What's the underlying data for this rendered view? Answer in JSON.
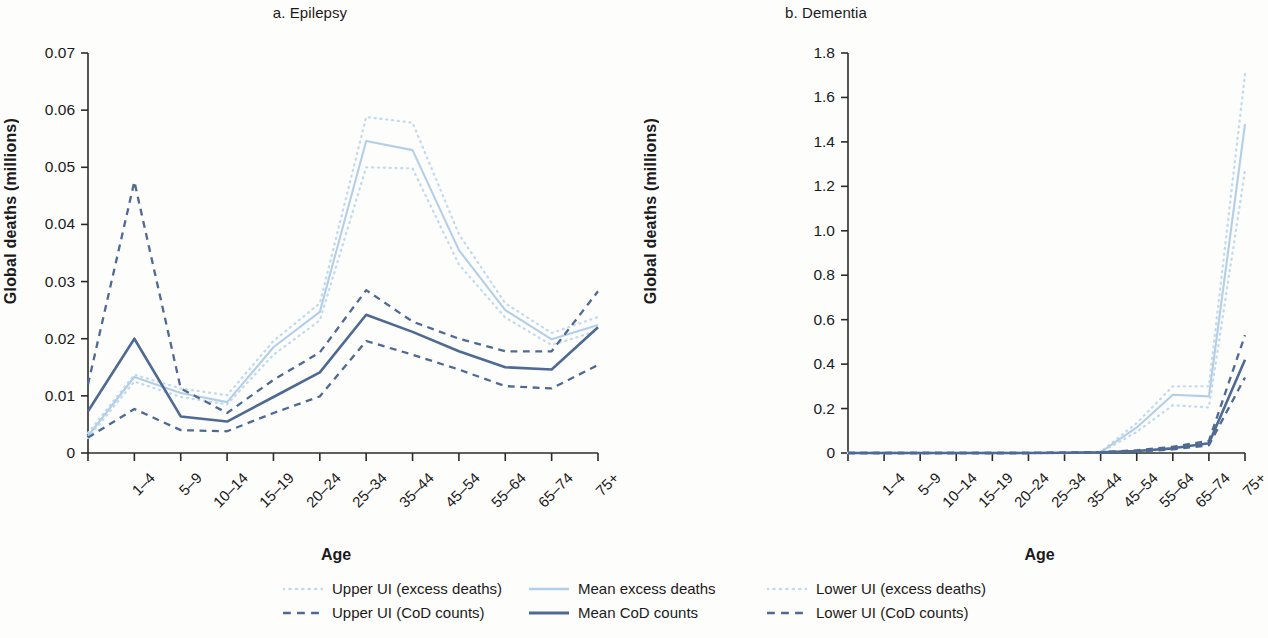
{
  "figure": {
    "background": "#fdfdfb",
    "axis_color": "#2b2b2b"
  },
  "colors": {
    "excess": "#b3cfe8",
    "excess_ui": "#c3daee",
    "cod": "#4e6a93",
    "cod_ui": "#4e6a93"
  },
  "legend": {
    "items": [
      {
        "label": "Upper UI (excess deaths)",
        "style": "dotted",
        "color": "#c3daee"
      },
      {
        "label": "Mean excess deaths",
        "style": "solid",
        "color": "#b3cfe8"
      },
      {
        "label": "Lower UI (excess deaths)",
        "style": "dotted",
        "color": "#c3daee"
      },
      {
        "label": "Upper UI (CoD counts)",
        "style": "dashed",
        "color": "#4e6a93"
      },
      {
        "label": "Mean CoD counts",
        "style": "solid",
        "color": "#4e6a93"
      },
      {
        "label": "Lower UI (CoD counts)",
        "style": "dashed",
        "color": "#4e6a93"
      }
    ]
  },
  "chart_data": [
    {
      "type": "line",
      "panel": "a",
      "title": "a. Epilepsy",
      "xlabel": "Age",
      "ylabel": "Global deaths (millions)",
      "grid": false,
      "legend_position": "bottom",
      "categories": [
        "<1",
        "1–4",
        "5–9",
        "10–14",
        "15–19",
        "20–24",
        "25–34",
        "35–44",
        "45–54",
        "55–64",
        "65–74",
        "75+"
      ],
      "tick_labels": [
        "",
        "1–4",
        "5–9",
        "10–14",
        "15–19",
        "20–24",
        "25–34",
        "35–44",
        "45–54",
        "55–64",
        "65–74",
        "75+"
      ],
      "ylim": [
        0,
        0.07
      ],
      "yticks": [
        0,
        0.01,
        0.02,
        0.03,
        0.04,
        0.05,
        0.06,
        0.07
      ],
      "ytick_labels": [
        "0",
        "0.01",
        "0.02",
        "0.03",
        "0.04",
        "0.05",
        "0.06",
        "0.07"
      ],
      "series": [
        {
          "name": "Upper UI (excess deaths)",
          "style": "dotted",
          "color": "#c3daee",
          "values": [
            0.0035,
            0.0137,
            0.0113,
            0.0101,
            0.0196,
            0.0262,
            0.0588,
            0.0578,
            0.0383,
            0.0262,
            0.021,
            0.0238
          ]
        },
        {
          "name": "Mean excess deaths",
          "style": "solid",
          "color": "#b3cfe8",
          "values": [
            0.003,
            0.0133,
            0.0105,
            0.0089,
            0.0185,
            0.0247,
            0.0546,
            0.053,
            0.0355,
            0.025,
            0.0199,
            0.0224
          ]
        },
        {
          "name": "Lower UI (excess deaths)",
          "style": "dotted",
          "color": "#c3daee",
          "values": [
            0.0026,
            0.0125,
            0.0098,
            0.0085,
            0.0172,
            0.0232,
            0.05,
            0.0498,
            0.033,
            0.0237,
            0.0189,
            0.0214
          ]
        },
        {
          "name": "Upper UI (CoD counts)",
          "style": "dashed",
          "color": "#4e6a93",
          "values": [
            0.012,
            0.0475,
            0.0113,
            0.007,
            0.0128,
            0.0176,
            0.0285,
            0.023,
            0.02,
            0.0178,
            0.0178,
            0.0283
          ]
        },
        {
          "name": "Mean CoD counts",
          "style": "solid",
          "color": "#4e6a93",
          "values": [
            0.0073,
            0.02,
            0.0064,
            0.0055,
            0.0098,
            0.0141,
            0.0242,
            0.0212,
            0.0178,
            0.015,
            0.0146,
            0.022
          ]
        },
        {
          "name": "Lower UI (CoD counts)",
          "style": "dashed",
          "color": "#4e6a93",
          "values": [
            0.0027,
            0.0077,
            0.004,
            0.0038,
            0.007,
            0.0099,
            0.0196,
            0.0172,
            0.0146,
            0.0117,
            0.0113,
            0.0154
          ]
        }
      ]
    },
    {
      "type": "line",
      "panel": "b",
      "title": "b. Dementia",
      "xlabel": "Age",
      "ylabel": "Global deaths (millions)",
      "grid": false,
      "legend_position": "bottom",
      "categories": [
        "<1",
        "1–4",
        "5–9",
        "10–14",
        "15–19",
        "20–24",
        "25–34",
        "35–44",
        "45–54",
        "55–64",
        "65–74",
        "75+"
      ],
      "tick_labels": [
        "",
        "1–4",
        "5–9",
        "10–14",
        "15–19",
        "20–24",
        "25–34",
        "35–44",
        "45–54",
        "55–64",
        "65–74",
        "75+"
      ],
      "ylim": [
        0,
        1.8
      ],
      "yticks": [
        0,
        0.2,
        0.4,
        0.6,
        0.8,
        1.0,
        1.2,
        1.4,
        1.6,
        1.8
      ],
      "ytick_labels": [
        "0",
        "0.2",
        "0.4",
        "0.6",
        "0.8",
        "1.0",
        "1.2",
        "1.4",
        "1.6",
        "1.8"
      ],
      "series": [
        {
          "name": "Upper UI (excess deaths)",
          "style": "dotted",
          "color": "#c3daee",
          "values": [
            0,
            0,
            0,
            0,
            0,
            0,
            0,
            0.005,
            0.135,
            0.3,
            0.3,
            1.705
          ]
        },
        {
          "name": "Mean excess deaths",
          "style": "solid",
          "color": "#b3cfe8",
          "values": [
            0,
            0,
            0,
            0,
            0,
            0,
            0,
            0.004,
            0.115,
            0.262,
            0.255,
            1.48
          ]
        },
        {
          "name": "Lower UI (excess deaths)",
          "style": "dotted",
          "color": "#c3daee",
          "values": [
            0,
            0,
            0,
            0,
            0,
            0,
            0,
            0.003,
            0.095,
            0.215,
            0.205,
            1.27
          ]
        },
        {
          "name": "Upper UI (CoD counts)",
          "style": "dashed",
          "color": "#4e6a93",
          "values": [
            0,
            0,
            0,
            0,
            0,
            0,
            0.002,
            0.004,
            0.012,
            0.028,
            0.055,
            0.53
          ]
        },
        {
          "name": "Mean CoD counts",
          "style": "solid",
          "color": "#4e6a93",
          "values": [
            0,
            0,
            0,
            0,
            0,
            0,
            0.001,
            0.003,
            0.009,
            0.021,
            0.044,
            0.42
          ]
        },
        {
          "name": "Lower UI (CoD counts)",
          "style": "dashed",
          "color": "#4e6a93",
          "values": [
            0,
            0,
            0,
            0,
            0,
            0,
            0.001,
            0.002,
            0.007,
            0.016,
            0.035,
            0.34
          ]
        }
      ]
    }
  ]
}
